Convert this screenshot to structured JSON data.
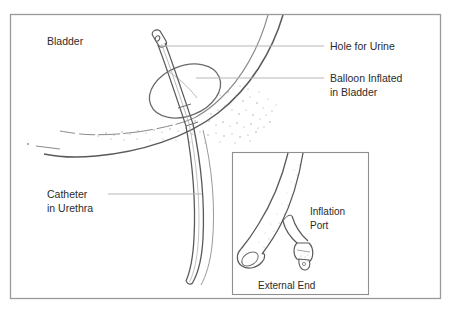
{
  "figure": {
    "background_color": "#ffffff",
    "frame_color": "#9a9a9a",
    "ink_color": "#4a4a4a",
    "label_color": "#2b2b2b",
    "leader_color": "#b5b5b5"
  },
  "labels": {
    "bladder": "Bladder",
    "hole_for_urine": "Hole for Urine",
    "balloon_inflated_line1": "Balloon Inflated",
    "balloon_inflated_line2": "in Bladder",
    "catheter_line1": "Catheter",
    "catheter_line2": "in Urethra"
  },
  "inset": {
    "inflation_port_line1": "Inflation",
    "inflation_port_line2": "Port",
    "external_end": "External End"
  }
}
